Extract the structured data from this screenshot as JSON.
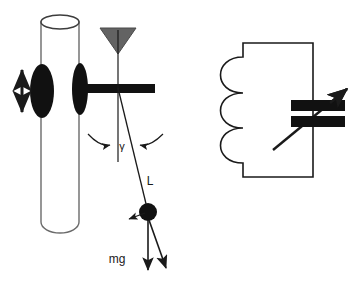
{
  "figure": {
    "name": "pendulum-on-vibrating-cylinder-and-variable-inductor",
    "background_color": "#ffffff",
    "width": 355,
    "height": 285,
    "stroke_color": "#1a1a1a",
    "fill_black": "#111111",
    "fill_gray": "#636363",
    "cylinder_outline_color": "#6b6b6b"
  },
  "left_panel": {
    "name": "pendulum-assembly",
    "cylinder": {
      "name": "vertical-cylinder",
      "center_x": 60,
      "top_y": 22,
      "bottom_y": 232,
      "half_width": 19,
      "ellipse_ry": 7
    },
    "oscillation_arrow": {
      "name": "vertical-double-arrow",
      "x": 22,
      "top_y": 66,
      "bottom_y": 116,
      "meaning": "vertical oscillation"
    },
    "left_disk": {
      "name": "left-disk-ellipse",
      "cx": 42,
      "cy": 91,
      "rx": 12,
      "ry": 27
    },
    "right_disk": {
      "name": "right-disk-ellipse",
      "cx": 80,
      "cy": 89,
      "rx": 8,
      "ry": 26
    },
    "horizontal_bar": {
      "name": "horizontal-support-bar",
      "x1": 78,
      "x2": 155,
      "y": 84,
      "thickness": 9
    },
    "pivot_triangle": {
      "name": "pivot-triangle",
      "apex_x": 118,
      "apex_y": 54,
      "left_x": 100,
      "right_x": 136,
      "top_y": 28,
      "fill": "#636363"
    },
    "vertical_reference_line": {
      "name": "vertical-reference-line",
      "x": 118,
      "top_y": 30,
      "bottom_y": 162
    },
    "pendulum_string": {
      "name": "pendulum-string",
      "x1": 118,
      "y1": 88,
      "x2": 148,
      "y2": 212
    },
    "bob": {
      "name": "pendulum-bob",
      "cx": 148,
      "cy": 212,
      "r": 9
    },
    "angle_arc_left": {
      "name": "angle-arc-arrow-left",
      "label_target": "gamma"
    },
    "angle_arc_right": {
      "name": "angle-arc-arrow-right",
      "label_target": "gamma"
    },
    "mg_arrow": {
      "name": "weight-arrow",
      "x1": 148,
      "y1": 219,
      "x2": 148,
      "y2": 272
    },
    "tension_arrow": {
      "name": "diagonal-force-arrow",
      "x1": 148,
      "y1": 219,
      "x2": 166,
      "y2": 270
    },
    "small_arrow": {
      "name": "small-left-arrow",
      "x1": 146,
      "y1": 212,
      "x2": 128,
      "y2": 219
    },
    "labels": {
      "angle": "γ",
      "length": "L",
      "weight": "mg"
    }
  },
  "right_panel": {
    "name": "variable-inductor-assembly",
    "body_rect": {
      "name": "inductor-body-rectangle",
      "x": 243,
      "y": 43,
      "width": 70,
      "height": 134
    },
    "coil": {
      "name": "coil-windings",
      "loop_count": 3,
      "left_x": 243,
      "bulge": 30,
      "top_y": 57,
      "bottom_y": 163
    },
    "core_bars": [
      {
        "name": "ferrite-core-bar-upper",
        "x": 291,
        "y": 100,
        "width": 54,
        "height": 11
      },
      {
        "name": "ferrite-core-bar-lower",
        "x": 291,
        "y": 116,
        "width": 54,
        "height": 11
      }
    ],
    "tuning_arrow": {
      "name": "tuning-arrow",
      "x1": 273,
      "y1": 150,
      "x2": 348,
      "y2": 88,
      "meaning": "adjustable / variable"
    }
  }
}
